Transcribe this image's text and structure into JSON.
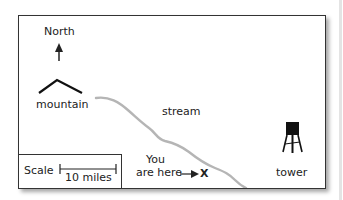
{
  "map": {
    "north_label": "North",
    "mountain_label": "mountain",
    "stream_label": "stream",
    "you_are_here_line1": "You",
    "you_are_here_line2": "are here",
    "marker": "X",
    "tower_label": "tower",
    "scale_label": "Scale",
    "scale_distance": "10 miles",
    "icons": [
      "north-arrow-icon",
      "mountain-icon",
      "stream-path",
      "arrow-right-icon",
      "water-tower-icon",
      "scale-bar"
    ],
    "colors": {
      "border": "#333333",
      "stream": "#b5b5b5",
      "ink": "#222222"
    }
  }
}
